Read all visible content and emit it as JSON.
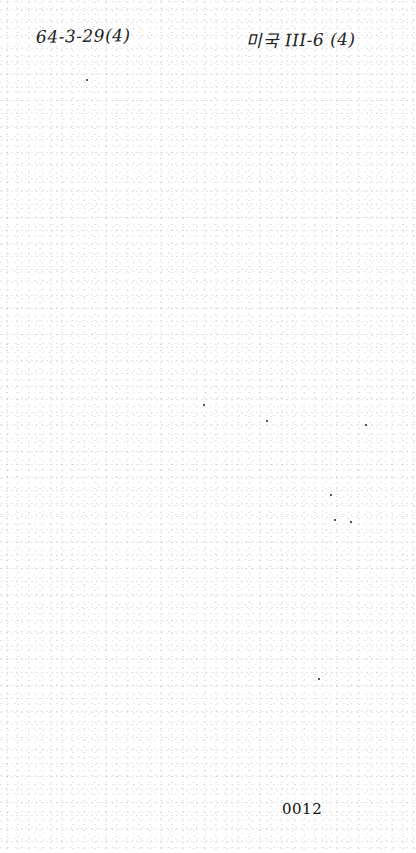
{
  "document": {
    "header": {
      "left_annotation": "64-3-29(4)",
      "right_annotation": "미국 III-6 (4)"
    },
    "body": {
      "content": ""
    },
    "footer": {
      "page_number": "0012"
    }
  }
}
